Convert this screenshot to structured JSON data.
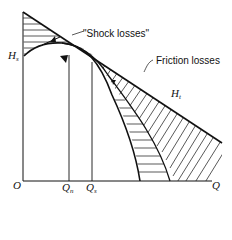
{
  "labels": {
    "shock_losses": "\"Shock losses\"",
    "friction_losses": "Friction losses",
    "hs_main": "H",
    "hs_sub": "s",
    "ht_main": "H",
    "ht_sub": "t",
    "origin": "O",
    "q_axis": "Q",
    "qn_main": "Q",
    "qn_sub": "n",
    "qs_main": "Q",
    "qs_sub": "s"
  },
  "colors": {
    "line": "#111111",
    "background": "#ffffff"
  }
}
